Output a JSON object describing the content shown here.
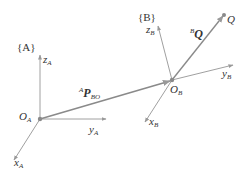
{
  "diagram": {
    "title": "",
    "colors": {
      "axis": "#999999",
      "vector": "#8a8a8a",
      "text": "#333333",
      "point": "#8a8a8a"
    },
    "frame_A": {
      "label": "{A}",
      "origin_label": {
        "main": "O",
        "sub": "A"
      },
      "axes": {
        "z": {
          "main": "z",
          "sub": "A"
        },
        "y": {
          "main": "y",
          "sub": "A"
        },
        "x": {
          "main": "x",
          "sub": "A"
        }
      }
    },
    "frame_B": {
      "label": "{B}",
      "origin_label": {
        "main": "O",
        "sub": "B"
      },
      "axes": {
        "z": {
          "main": "z",
          "sub": "B"
        },
        "y": {
          "main": "y",
          "sub": "B"
        },
        "x": {
          "main": "x",
          "sub": "B"
        }
      }
    },
    "vector_P": {
      "pre": "A",
      "main": "P",
      "sub": "BO"
    },
    "vector_Q": {
      "pre": "B",
      "main": "Q"
    },
    "point_Q": {
      "label": "Q"
    }
  }
}
